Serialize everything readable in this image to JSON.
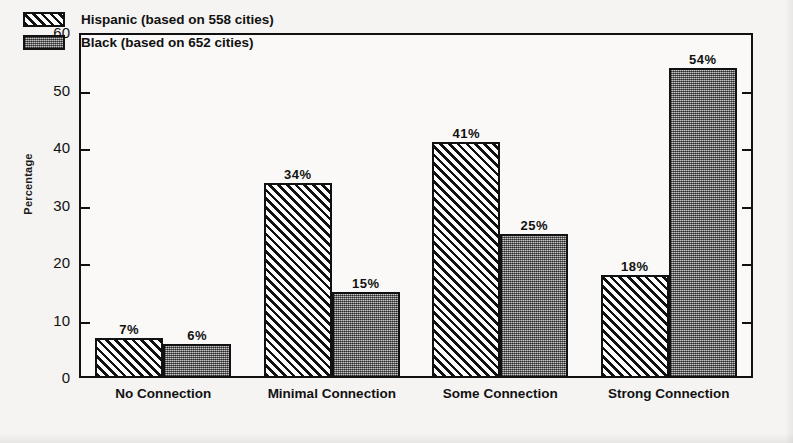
{
  "chart_data": {
    "type": "bar",
    "title": "",
    "xlabel": "",
    "ylabel": "Percentage",
    "ylim": [
      0,
      60
    ],
    "yticks": [
      0,
      10,
      20,
      30,
      40,
      50,
      60
    ],
    "ytick_labels": [
      "0",
      "10",
      "20",
      "30",
      "40",
      "50",
      "60"
    ],
    "grid": false,
    "legend_position": "top-left",
    "categories": [
      "No Connection",
      "Minimal Connection",
      "Some Connection",
      "Strong Connection"
    ],
    "series": [
      {
        "name": "Hispanic (based on 558 cities)",
        "short_name": "Hispanic",
        "fill": "diagonal-hatch",
        "values": [
          7,
          34,
          41,
          18
        ],
        "value_labels": [
          "7%",
          "34%",
          "41%",
          "18%"
        ]
      },
      {
        "name": "Black (based on 652 cities)",
        "short_name": "Black",
        "fill": "stipple-dots",
        "values": [
          6,
          15,
          25,
          54
        ],
        "value_labels": [
          "6%",
          "15%",
          "25%",
          "54%"
        ]
      }
    ],
    "colors": {
      "axis": "#111111",
      "hispanic_fill": "#fdfdfd",
      "black_fill": "#8a8a8a",
      "background": "#f5f4f2"
    }
  }
}
